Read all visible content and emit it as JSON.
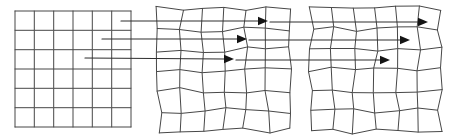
{
  "diagram": {
    "background": "#ffffff",
    "grid_line_color": "#474747",
    "arrow_line_color": "#2e2e2e",
    "arrowhead_color": "#141414",
    "canvas": {
      "width": 450,
      "height": 139
    },
    "grids": [
      {
        "name": "source-grid",
        "style": "regular",
        "x": 15,
        "y": 11,
        "width": 116,
        "height": 116,
        "rows": 6,
        "cols": 6,
        "jitter": 0,
        "seed": 1
      },
      {
        "name": "deformed-grid-1",
        "style": "warped",
        "x": 159,
        "y": 9,
        "width": 130,
        "height": 122,
        "rows": 6,
        "cols": 6,
        "jitter": 3.0,
        "seed": 7
      },
      {
        "name": "deformed-grid-2",
        "style": "warped",
        "x": 311,
        "y": 9,
        "width": 129,
        "height": 122,
        "rows": 6,
        "cols": 6,
        "jitter": 3.0,
        "seed": 29
      }
    ],
    "arrows": [
      {
        "name": "mapping-arrow-1",
        "start": [
          121,
          21
        ],
        "mid_tip": [
          268,
          21
        ],
        "end_tip": [
          428,
          22
        ]
      },
      {
        "name": "mapping-arrow-2",
        "start": [
          102,
          39
        ],
        "mid_tip": [
          247,
          39
        ],
        "end_tip": [
          410,
          40
        ]
      },
      {
        "name": "mapping-arrow-3",
        "start": [
          85,
          58
        ],
        "mid_tip": [
          234,
          59
        ],
        "end_tip": [
          390,
          60
        ]
      }
    ],
    "arrowhead": {
      "length": 10,
      "half_width": 4.2,
      "gap_after_tip": 2
    }
  }
}
